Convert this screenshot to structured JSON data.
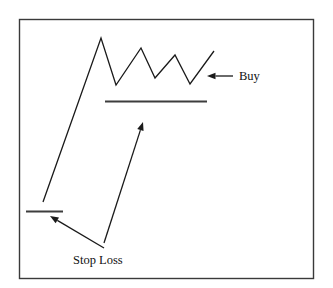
{
  "figure": {
    "title": "",
    "background_color": "#ffffff",
    "border_color": "#3a3a3a",
    "line_color": "#1a1a1a",
    "level_color": "#3d3d3d"
  },
  "labels": {
    "buy": "Buy",
    "stop_loss": "Stop Loss"
  },
  "chart_data": {
    "type": "line",
    "title": "",
    "xlabel": "",
    "ylabel": "",
    "grid": false,
    "legend": "none",
    "xlim": [
      19,
      313
    ],
    "ylim": [
      278,
      19
    ],
    "series": [
      {
        "name": "price-path",
        "comment": "Rising trend then descending-triangle / pennant consolidation then breakout",
        "points": [
          [
            43,
            202
          ],
          [
            101,
            38
          ],
          [
            116,
            85
          ],
          [
            141,
            48
          ],
          [
            155,
            78
          ],
          [
            175,
            55
          ],
          [
            190,
            84
          ],
          [
            214,
            51
          ]
        ]
      }
    ],
    "levels": [
      {
        "name": "resistance-support-line",
        "y": 101,
        "x1": 105,
        "x2": 207
      },
      {
        "name": "stop-loss-line",
        "y": 211,
        "x1": 26,
        "x2": 63
      }
    ],
    "annotations": [
      {
        "name": "buy",
        "text": "Buy",
        "text_x": 239,
        "text_y": 80,
        "arrow_tail": [
          233,
          76
        ],
        "arrow_tip": [
          207,
          76
        ]
      },
      {
        "name": "stop-loss",
        "text": "Stop Loss",
        "text_x": 73,
        "text_y": 264,
        "arrow_tail": [
          104,
          248
        ],
        "arrow_tip": [
          50,
          216
        ]
      },
      {
        "name": "breakout-pointer",
        "text": "",
        "arrow_tail": [
          104,
          243
        ],
        "arrow_tip": [
          143,
          122
        ]
      }
    ]
  }
}
